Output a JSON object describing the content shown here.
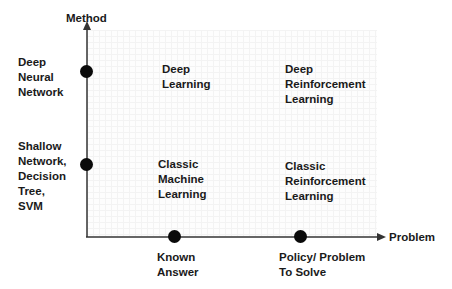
{
  "diagram": {
    "y_axis": {
      "title": "Method",
      "points": [
        {
          "label": "Deep\nNeural\nNetwork"
        },
        {
          "label": "Shallow\nNetwork,\nDecision\nTree,\nSVM"
        }
      ]
    },
    "x_axis": {
      "title": "Problem",
      "points": [
        {
          "label": "Known\nAnswer"
        },
        {
          "label": "Policy/ Problem\nTo Solve"
        }
      ]
    },
    "quadrants": {
      "top_left": "Deep\nLearning",
      "top_right": "Deep\nReinforcement\nLearning",
      "bottom_left": "Classic\nMachine\nLearning",
      "bottom_right": "Classic\nReinforcement\nLearning"
    },
    "colors": {
      "axis": "#333333",
      "dot": "#0a0a0a",
      "text": "#1a1a1a"
    }
  }
}
